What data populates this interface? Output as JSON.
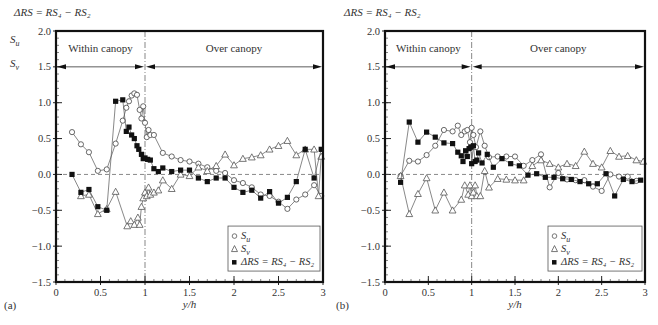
{
  "chart_data": [
    {
      "type": "line",
      "panel_label": "(a)",
      "top_label": "ΔRS = RS₄ − RS₂",
      "ylabel_lines": [
        "S_u",
        "S_v"
      ],
      "xlabel": "y/h",
      "xlim": [
        0,
        3
      ],
      "ylim": [
        -1.5,
        2.0
      ],
      "xticks": [
        "0",
        "0.5",
        "1",
        "1.5",
        "2",
        "2.5",
        "3"
      ],
      "yticks": [
        "2.0",
        "1.5",
        "1.0",
        "0.5",
        "0.0",
        "−0.5",
        "−1.0",
        "−1.5"
      ],
      "regions": [
        {
          "label": "Within canopy",
          "from": 0,
          "to": 1
        },
        {
          "label": "Over canopy",
          "from": 1,
          "to": 3
        }
      ],
      "region_arrow_y": 1.5,
      "divider_x": 1,
      "zero_line": true,
      "legend": {
        "placement": "bottom-right",
        "entries": [
          {
            "marker": "circle-open",
            "label": "S_u"
          },
          {
            "marker": "triangle-open",
            "label": "S_v"
          },
          {
            "marker": "square-filled",
            "label": "ΔRS = RS₄ − RS₂"
          }
        ]
      },
      "series": [
        {
          "name": "S_u",
          "marker": "circle-open",
          "x": [
            0.18,
            0.28,
            0.37,
            0.47,
            0.57,
            0.67,
            0.75,
            0.79,
            0.82,
            0.85,
            0.88,
            0.91,
            0.94,
            0.96,
            0.98,
            1.0,
            1.02,
            1.04,
            1.06,
            1.1,
            1.2,
            1.3,
            1.4,
            1.5,
            1.6,
            1.7,
            1.8,
            1.9,
            2.0,
            2.1,
            2.2,
            2.3,
            2.4,
            2.5,
            2.6,
            2.7,
            2.8,
            2.9,
            2.98
          ],
          "y": [
            0.59,
            0.42,
            0.31,
            0.05,
            0.07,
            0.43,
            0.75,
            0.93,
            1.02,
            1.1,
            1.13,
            1.11,
            0.9,
            0.78,
            0.95,
            0.72,
            0.52,
            0.62,
            0.55,
            0.55,
            0.3,
            0.25,
            0.2,
            0.18,
            0.15,
            0.1,
            0.05,
            0.02,
            -0.08,
            -0.12,
            -0.18,
            -0.28,
            -0.3,
            -0.38,
            -0.48,
            -0.35,
            -0.28,
            -0.15,
            -0.3
          ]
        },
        {
          "name": "S_v",
          "marker": "triangle-open",
          "x": [
            0.28,
            0.37,
            0.47,
            0.57,
            0.67,
            0.8,
            0.84,
            0.88,
            0.92,
            0.94,
            0.96,
            0.98,
            1.0,
            1.02,
            1.04,
            1.06,
            1.1,
            1.15,
            1.2,
            1.3,
            1.4,
            1.5,
            1.6,
            1.7,
            1.8,
            1.9,
            2.0,
            2.1,
            2.2,
            2.3,
            2.4,
            2.5,
            2.6,
            2.7,
            2.8,
            2.9,
            2.95,
            2.98
          ],
          "y": [
            -0.3,
            -0.28,
            -0.55,
            -0.48,
            -0.24,
            -0.72,
            -0.65,
            -0.7,
            -0.6,
            -0.7,
            -0.45,
            -0.33,
            -0.25,
            -0.3,
            -0.18,
            -0.28,
            -0.25,
            -0.22,
            -0.08,
            -0.2,
            0.0,
            -0.02,
            0.1,
            0.05,
            0.12,
            0.28,
            0.13,
            0.22,
            0.24,
            0.27,
            0.35,
            0.4,
            0.47,
            0.27,
            0.35,
            0.35,
            -0.3,
            0.25
          ]
        },
        {
          "name": "ΔRS = RS₄ − RS₂",
          "marker": "square-filled",
          "x": [
            0.18,
            0.28,
            0.37,
            0.47,
            0.57,
            0.67,
            0.75,
            0.79,
            0.82,
            0.85,
            0.88,
            0.91,
            0.93,
            0.96,
            0.98,
            1.0,
            1.03,
            1.06,
            1.1,
            1.15,
            1.2,
            1.3,
            1.4,
            1.5,
            1.6,
            1.7,
            1.8,
            1.9,
            2.0,
            2.1,
            2.2,
            2.3,
            2.4,
            2.5,
            2.6,
            2.7,
            2.8,
            2.9,
            2.98
          ],
          "y": [
            0.0,
            -0.25,
            -0.21,
            -0.45,
            -0.5,
            1.02,
            1.04,
            0.6,
            0.66,
            0.55,
            0.5,
            0.4,
            0.35,
            0.28,
            0.22,
            0.23,
            0.21,
            0.2,
            0.08,
            0.04,
            0.09,
            0.04,
            0.06,
            0.06,
            -0.05,
            -0.1,
            -0.05,
            -0.05,
            -0.18,
            -0.25,
            -0.22,
            -0.33,
            -0.24,
            -0.4,
            -0.32,
            -0.1,
            0.35,
            -0.05,
            0.35
          ]
        }
      ]
    },
    {
      "type": "line",
      "panel_label": "(b)",
      "top_label": "ΔRS = RS₄ − RS₂",
      "xlabel": "y/h",
      "xlim": [
        0,
        3
      ],
      "ylim": [
        -1.5,
        2.0
      ],
      "xticks": [
        "0",
        "0.5",
        "1",
        "1.5",
        "2",
        "2.5",
        "3"
      ],
      "yticks": [
        "2.0",
        "1.5",
        "1.0",
        "0.5",
        "0.0",
        "−0.5",
        "−1.0",
        "−1.5"
      ],
      "regions": [
        {
          "label": "Within canopy",
          "from": 0,
          "to": 1
        },
        {
          "label": "Over canopy",
          "from": 1,
          "to": 3
        }
      ],
      "region_arrow_y": 1.5,
      "divider_x": 1,
      "zero_line": true,
      "legend": {
        "placement": "bottom-right",
        "entries": [
          {
            "marker": "circle-open",
            "label": "S_u"
          },
          {
            "marker": "triangle-open",
            "label": "S_v"
          },
          {
            "marker": "square-filled",
            "label": "ΔRS = RS₄ − RS₂"
          }
        ]
      },
      "series": [
        {
          "name": "S_u",
          "marker": "circle-open",
          "x": [
            0.18,
            0.28,
            0.38,
            0.48,
            0.58,
            0.68,
            0.78,
            0.84,
            0.88,
            0.92,
            0.95,
            0.98,
            1.0,
            1.02,
            1.05,
            1.1,
            1.15,
            1.2,
            1.3,
            1.4,
            1.5,
            1.6,
            1.7,
            1.8,
            1.9,
            2.0,
            2.1,
            2.2,
            2.3,
            2.4,
            2.5,
            2.6,
            2.7,
            2.8,
            2.9
          ],
          "y": [
            -0.02,
            0.19,
            0.18,
            0.27,
            0.4,
            0.62,
            0.6,
            0.68,
            0.55,
            0.6,
            0.62,
            0.45,
            0.65,
            0.55,
            0.38,
            0.6,
            0.4,
            0.24,
            0.25,
            0.25,
            0.25,
            0.12,
            0.2,
            0.28,
            -0.18,
            0.02,
            -0.07,
            -0.08,
            -0.08,
            -0.17,
            -0.23,
            0.0,
            -0.03,
            -0.03,
            -0.09
          ]
        },
        {
          "name": "S_v",
          "marker": "triangle-open",
          "x": [
            0.18,
            0.28,
            0.38,
            0.48,
            0.58,
            0.68,
            0.78,
            0.88,
            0.92,
            0.96,
            0.98,
            1.0,
            1.02,
            1.04,
            1.06,
            1.1,
            1.15,
            1.2,
            1.3,
            1.4,
            1.5,
            1.6,
            1.7,
            1.8,
            1.9,
            2.0,
            2.1,
            2.2,
            2.3,
            2.4,
            2.5,
            2.6,
            2.7,
            2.8,
            2.9,
            2.98
          ],
          "y": [
            -0.02,
            -0.55,
            -0.27,
            -0.05,
            -0.5,
            -0.25,
            -0.5,
            -0.35,
            -0.15,
            -0.28,
            -0.15,
            -0.3,
            -0.25,
            -0.15,
            -0.3,
            -0.3,
            0.05,
            -0.18,
            -0.06,
            -0.07,
            -0.08,
            -0.08,
            0.12,
            0.2,
            0.15,
            0.1,
            0.15,
            0.12,
            0.32,
            0.15,
            0.1,
            0.33,
            0.25,
            0.26,
            0.2,
            0.18
          ]
        },
        {
          "name": "ΔRS = RS₄ − RS₂",
          "marker": "square-filled",
          "x": [
            0.18,
            0.28,
            0.38,
            0.48,
            0.58,
            0.68,
            0.78,
            0.84,
            0.88,
            0.9,
            0.93,
            0.95,
            0.97,
            0.99,
            1.0,
            1.02,
            1.04,
            1.06,
            1.08,
            1.12,
            1.18,
            1.25,
            1.35,
            1.45,
            1.55,
            1.65,
            1.75,
            1.85,
            1.95,
            2.05,
            2.15,
            2.25,
            2.35,
            2.45,
            2.55,
            2.65,
            2.75,
            2.85,
            2.95
          ],
          "y": [
            -0.11,
            0.73,
            0.45,
            0.59,
            0.52,
            0.44,
            0.43,
            0.31,
            0.26,
            0.18,
            0.33,
            0.25,
            0.36,
            0.38,
            0.15,
            0.4,
            0.18,
            0.2,
            0.3,
            0.16,
            0.28,
            0.1,
            0.22,
            0.15,
            0.12,
            -0.01,
            0.01,
            -0.04,
            -0.04,
            -0.06,
            -0.07,
            -0.1,
            -0.13,
            -0.13,
            0.01,
            -0.3,
            -0.07,
            -0.1,
            -0.08
          ]
        }
      ]
    }
  ]
}
